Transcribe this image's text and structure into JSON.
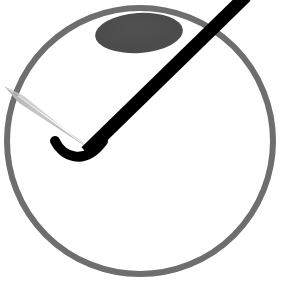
{
  "canvas": {
    "width": 281,
    "height": 294,
    "background": "#ffffff"
  },
  "colors": {
    "background": "#ffffff",
    "circle_outline": "#6e6e6e",
    "ellipse_fill": "#4a4a4a",
    "needle": "#000000",
    "hook": "#000000",
    "wedge_light": "#c3c3c3",
    "wedge_dark": "#a8a8a8"
  },
  "shapes": {
    "outer_circle": {
      "name": "outer circle",
      "center_x": 140,
      "center_y": 141,
      "radius": 133,
      "stroke_width": 6,
      "stroke": "#6e6e6e",
      "fill": "none"
    },
    "dark_ellipse": {
      "name": "dark ellipse",
      "center_x": 139,
      "center_y": 33,
      "radius_x": 44,
      "radius_y": 20,
      "rotation_deg": -4,
      "fill": "#4a4a4a"
    },
    "needle": {
      "name": "needle shaft",
      "x1": 246,
      "y1": -4,
      "x2": 86,
      "y2": 152,
      "stroke_width": 13,
      "stroke": "#000000"
    },
    "hook": {
      "name": "hook tip",
      "start_x": 103,
      "start_y": 141,
      "control_1_x": 84,
      "control_1_y": 167,
      "control_2_x": 62,
      "control_2_y": 156,
      "end_x": 55,
      "end_y": 141,
      "stroke_width": 10,
      "stroke": "#000000"
    },
    "wedge": {
      "name": "light gray wedge",
      "apex_x": 88,
      "apex_y": 148,
      "base_a_x": 4,
      "base_a_y": 86,
      "base_b_x": 19,
      "base_b_y": 103,
      "fill": "#bfbfbf"
    }
  },
  "labels": {
    "title": "",
    "caption": ""
  }
}
